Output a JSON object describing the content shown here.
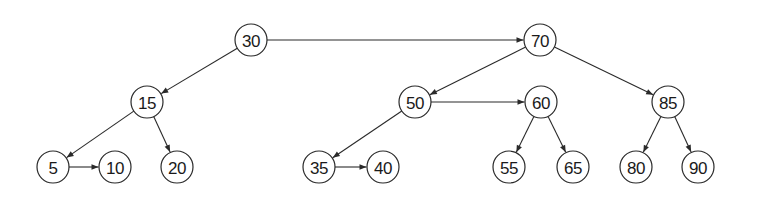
{
  "diagram": {
    "type": "tree",
    "colors": {
      "stroke": "#2a2a2a",
      "text": "#1a1a1a",
      "background": "#ffffff"
    },
    "node_radius": 16,
    "nodes": [
      {
        "id": "n30",
        "label": "30",
        "x": 251,
        "y": 40
      },
      {
        "id": "n70",
        "label": "70",
        "x": 540,
        "y": 40
      },
      {
        "id": "n15",
        "label": "15",
        "x": 147,
        "y": 102
      },
      {
        "id": "n50",
        "label": "50",
        "x": 415,
        "y": 102
      },
      {
        "id": "n60",
        "label": "60",
        "x": 541,
        "y": 102
      },
      {
        "id": "n85",
        "label": "85",
        "x": 668,
        "y": 102
      },
      {
        "id": "n5",
        "label": "5",
        "x": 53,
        "y": 167
      },
      {
        "id": "n10",
        "label": "10",
        "x": 115,
        "y": 167
      },
      {
        "id": "n20",
        "label": "20",
        "x": 177,
        "y": 167
      },
      {
        "id": "n35",
        "label": "35",
        "x": 319,
        "y": 167
      },
      {
        "id": "n40",
        "label": "40",
        "x": 383,
        "y": 167
      },
      {
        "id": "n55",
        "label": "55",
        "x": 509,
        "y": 167
      },
      {
        "id": "n65",
        "label": "65",
        "x": 573,
        "y": 167
      },
      {
        "id": "n80",
        "label": "80",
        "x": 636,
        "y": 167
      },
      {
        "id": "n90",
        "label": "90",
        "x": 698,
        "y": 167
      }
    ],
    "edges": [
      {
        "from": "n30",
        "to": "n70",
        "kind": "sibling"
      },
      {
        "from": "n30",
        "to": "n15",
        "kind": "child"
      },
      {
        "from": "n70",
        "to": "n50",
        "kind": "child"
      },
      {
        "from": "n70",
        "to": "n85",
        "kind": "child"
      },
      {
        "from": "n15",
        "to": "n5",
        "kind": "child"
      },
      {
        "from": "n15",
        "to": "n20",
        "kind": "child"
      },
      {
        "from": "n5",
        "to": "n10",
        "kind": "sibling"
      },
      {
        "from": "n50",
        "to": "n60",
        "kind": "sibling"
      },
      {
        "from": "n50",
        "to": "n35",
        "kind": "child"
      },
      {
        "from": "n35",
        "to": "n40",
        "kind": "sibling"
      },
      {
        "from": "n60",
        "to": "n55",
        "kind": "child"
      },
      {
        "from": "n60",
        "to": "n65",
        "kind": "child"
      },
      {
        "from": "n85",
        "to": "n80",
        "kind": "child"
      },
      {
        "from": "n85",
        "to": "n90",
        "kind": "child"
      }
    ]
  }
}
